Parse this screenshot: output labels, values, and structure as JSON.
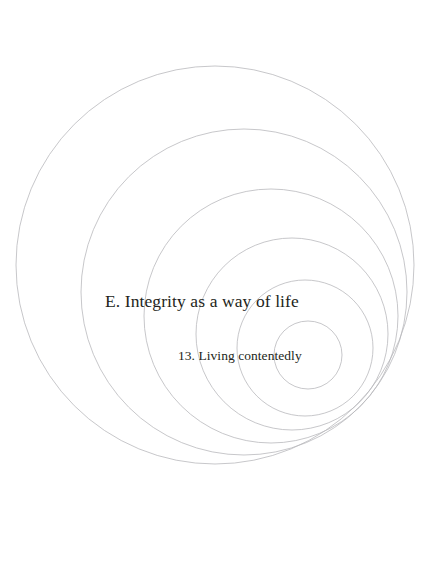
{
  "page": {
    "width": 432,
    "height": 572,
    "background_color": "#ffffff",
    "type": "book-section-divider"
  },
  "text": {
    "section_title": "E. Integrity as a way of life",
    "chapter_title": "13. Living contentedly",
    "text_color": "#231f20"
  },
  "decoration": {
    "name": "concentric-circles",
    "stroke_color": "#b9b9bd",
    "stroke_width": 0.8,
    "fill": "none",
    "circles": [
      {
        "id": "ring-1",
        "cx": 215,
        "cy": 265,
        "r": 199
      },
      {
        "id": "ring-2",
        "cx": 244,
        "cy": 292,
        "r": 163
      },
      {
        "id": "ring-3",
        "cx": 271,
        "cy": 316,
        "r": 127
      },
      {
        "id": "ring-4",
        "cx": 292,
        "cy": 334,
        "r": 96
      },
      {
        "id": "ring-5",
        "cx": 305,
        "cy": 348,
        "r": 68
      },
      {
        "id": "ring-6",
        "cx": 308,
        "cy": 355,
        "r": 34
      }
    ]
  }
}
